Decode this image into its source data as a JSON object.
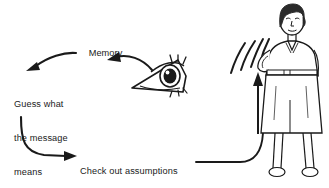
{
  "diagram": {
    "background_color": "#ffffff",
    "ink_color": "#1a1a1a",
    "labels": {
      "memory": "Memory",
      "guess_line1": "Guess what",
      "guess_line2": "the message",
      "guess_line3": "means",
      "check_line1": "Check out assumptions",
      "check_line2": "with the person (ask)"
    },
    "nodes": [
      {
        "name": "memory-node",
        "text": "Memory"
      },
      {
        "name": "guess-node",
        "text": "Guess what the message means"
      },
      {
        "name": "check-node",
        "text": "Check out assumptions with the person (ask)"
      },
      {
        "name": "eye-node",
        "text": "eye"
      },
      {
        "name": "person-node",
        "text": "person speaking"
      }
    ],
    "arrows": [
      {
        "name": "arrow-memory-to-guess",
        "from": "Memory",
        "to": "Guess what the message means",
        "style": "curved"
      },
      {
        "name": "arrow-eye-to-memory",
        "from": "eye",
        "to": "Memory",
        "style": "curved"
      },
      {
        "name": "arrow-guess-to-check",
        "from": "Guess what the message means",
        "to": "Check out assumptions with the person (ask)",
        "style": "curved"
      },
      {
        "name": "arrow-check-to-person",
        "from": "Check out assumptions with the person (ask)",
        "to": "person",
        "style": "curved"
      },
      {
        "name": "arrow-up-to-person",
        "from": "bottom",
        "to": "person",
        "style": "straight"
      }
    ],
    "icons": {
      "eye": "eye-icon",
      "person": "person-icon",
      "sound_waves": "sound-wave-icon"
    }
  }
}
